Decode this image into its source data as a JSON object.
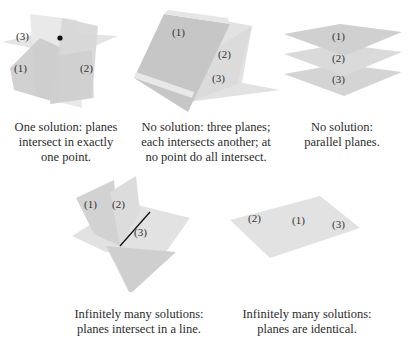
{
  "panels": [
    {
      "id": "one-solution",
      "plane_labels": [
        "(1)",
        "(2)",
        "(3)"
      ],
      "caption_lines": [
        "One solution: planes",
        "intersect in exactly",
        "one point."
      ],
      "marker": "intersection-point"
    },
    {
      "id": "no-solution-pairwise",
      "plane_labels": [
        "(1)",
        "(2)",
        "(3)"
      ],
      "caption_lines": [
        "No solution: three planes;",
        "each intersects another; at",
        "no point do all intersect."
      ]
    },
    {
      "id": "no-solution-parallel",
      "plane_labels": [
        "(1)",
        "(2)",
        "(3)"
      ],
      "caption_lines": [
        "No solution:",
        "parallel planes."
      ]
    },
    {
      "id": "infinite-line",
      "plane_labels": [
        "(1)",
        "(2)",
        "(3)"
      ],
      "caption_lines": [
        "Infinitely many solutions:",
        "planes intersect in a line."
      ],
      "marker": "intersection-line"
    },
    {
      "id": "infinite-identical",
      "plane_labels": [
        "(2)",
        "(1)",
        "(3)"
      ],
      "caption_lines": [
        "Infinitely many solutions:",
        "planes are identical."
      ]
    }
  ],
  "colors": {
    "plane_dark": "#c8c8c8",
    "plane_mid": "#d8d8d8",
    "plane_light": "#e6e6e6",
    "text": "#2b2b2b",
    "marker": "#111111"
  }
}
